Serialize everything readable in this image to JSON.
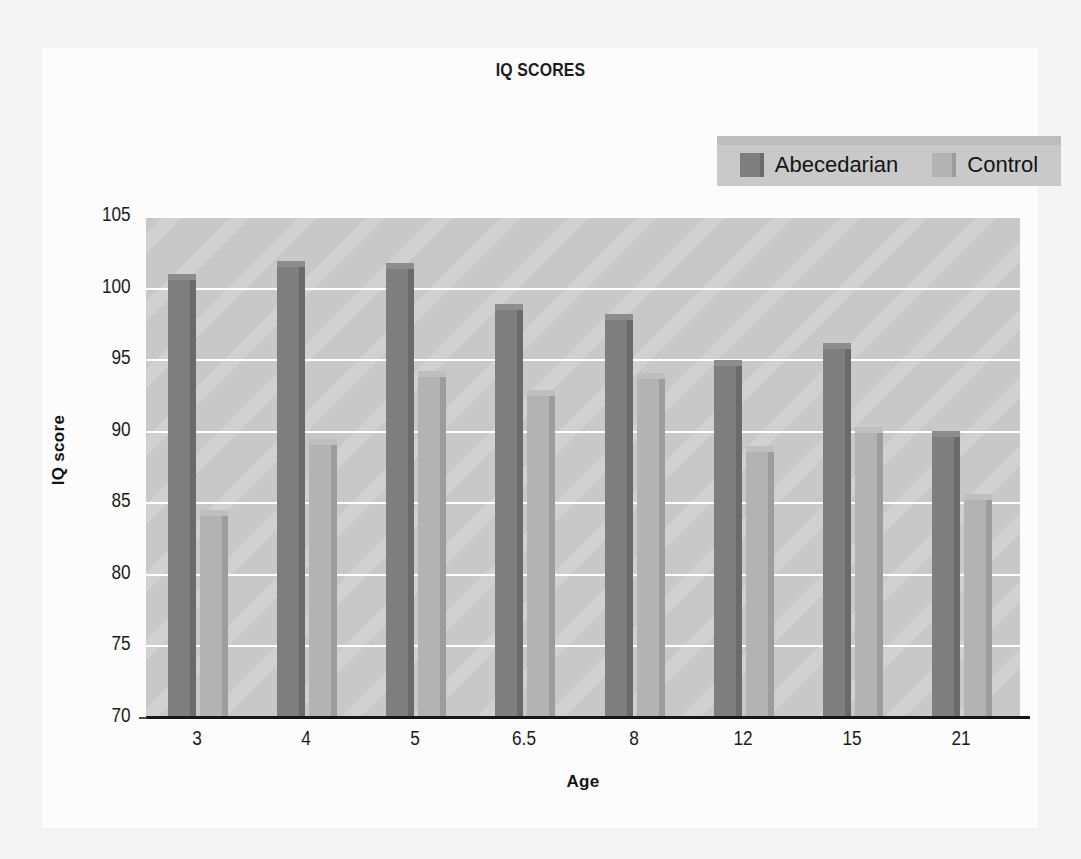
{
  "chart_data": {
    "type": "bar",
    "title": "IQ SCORES",
    "xlabel": "Age",
    "ylabel": "IQ score",
    "categories": [
      "3",
      "4",
      "5",
      "6.5",
      "8",
      "12",
      "15",
      "21"
    ],
    "series": [
      {
        "name": "Abecedarian",
        "color": "#7e7e7e",
        "values": [
          100.6,
          101.5,
          101.4,
          98.5,
          97.8,
          94.6,
          95.8,
          89.6
        ]
      },
      {
        "name": "Control",
        "color": "#b3b3b3",
        "values": [
          84.1,
          89.1,
          93.8,
          92.5,
          93.7,
          88.6,
          89.9,
          85.2
        ]
      }
    ],
    "ylim": [
      70,
      105
    ],
    "yticks": [
      70,
      75,
      80,
      85,
      90,
      95,
      100,
      105
    ],
    "ytick_labels": [
      "70",
      "75",
      "80",
      "85",
      "90",
      "95",
      "100",
      "105"
    ],
    "grid": true,
    "legend_position": "top-right",
    "plot_background": "#c8c8c8",
    "gridline_color": "#ffffff"
  },
  "legend": {
    "entries": [
      {
        "label": "Abecedarian"
      },
      {
        "label": "Control"
      }
    ]
  },
  "colors": {
    "abecedarian_face": "#7e7e7e",
    "abecedarian_side": "#6a6a6a",
    "abecedarian_top": "#8d8d8d",
    "control_face": "#b3b3b3",
    "control_side": "#9d9d9d",
    "control_top": "#bfbfbf",
    "plot_bg": "#c8c8c8",
    "grid": "#ffffff",
    "axis": "#171717",
    "text": "#1b1b1b"
  }
}
